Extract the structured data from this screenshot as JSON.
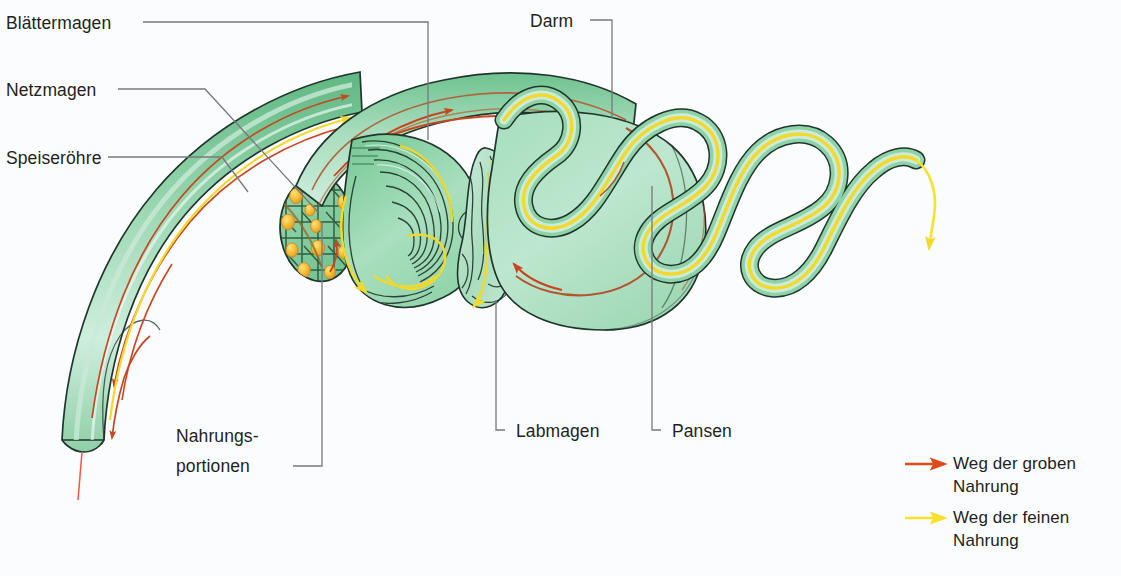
{
  "figure": {
    "background_color": "#fbfcfe"
  },
  "colors": {
    "coarse_path": "#de4a1c",
    "fine_path": "#f5e22b",
    "organ_green_light": "#bfe6cd",
    "organ_green_mid": "#8fd3a8",
    "organ_green_dark": "#5cb87f",
    "outline": "#20352b",
    "leader_line": "#77797c",
    "text": "#231f20",
    "bolus_orange": "#f2b32c"
  },
  "labels": {
    "blaettermagen": "Blättermagen",
    "netzmagen": "Netzmagen",
    "speiseroehre": "Speiseröhre",
    "darm": "Darm",
    "nahrungsportionen_line1": "Nahrungs-",
    "nahrungsportionen_line2": "portionen",
    "labmagen": "Labmagen",
    "pansen": "Pansen"
  },
  "legend": {
    "items": [
      {
        "arrow_color": "#de4a1c",
        "line1": "Weg der groben",
        "line2": "Nahrung"
      },
      {
        "arrow_color": "#f5e22b",
        "line1": "Weg der feinen",
        "line2": "Nahrung"
      }
    ]
  },
  "organs": [
    {
      "name": "speiseroehre",
      "label": "Speiseröhre"
    },
    {
      "name": "netzmagen",
      "label": "Netzmagen"
    },
    {
      "name": "blaettermagen",
      "label": "Blättermagen"
    },
    {
      "name": "labmagen",
      "label": "Labmagen"
    },
    {
      "name": "pansen",
      "label": "Pansen"
    },
    {
      "name": "darm",
      "label": "Darm"
    }
  ]
}
